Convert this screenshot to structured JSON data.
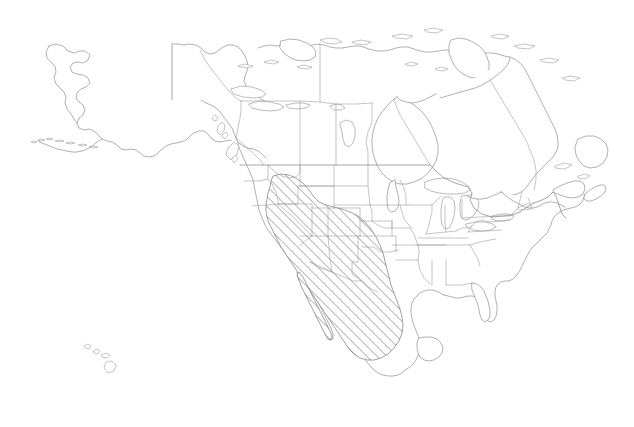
{
  "figure": {
    "kind": "range-map",
    "projection_note": "continental outline with first-level administrative subdivisions",
    "width_px": 634,
    "height_px": 427,
    "background_color": "#ffffff"
  },
  "styles": {
    "coastline_color": "#8c8f92",
    "subdivision_color": "#9a9da0",
    "national_border_color": "#85888b",
    "range_hatch_color": "#6b6e71",
    "range_fill_color": "#ffffff",
    "line_width_px": 0.7
  },
  "range": {
    "label": "shaded distribution area",
    "pattern": "diagonal-hatch",
    "hatch_angle_deg": 45,
    "hatch_spacing_px": 5,
    "hatch_stroke_width_px": 1.0,
    "coverage_note": "southwestern United States and northern Mexico including Baja California",
    "regions_covered": [
      "California",
      "Nevada",
      "Utah",
      "Arizona",
      "New Mexico",
      "southern Oregon",
      "southern Idaho",
      "western Colorado",
      "western Texas",
      "Baja California",
      "Sonora",
      "Chihuahua",
      "Coahuila",
      "Durango",
      "Zacatecas",
      "San Luis Potosi"
    ]
  },
  "landmasses": [
    {
      "name": "North American mainland",
      "type": "continent"
    },
    {
      "name": "Alaska",
      "type": "region"
    },
    {
      "name": "Aleutian Islands",
      "type": "island-chain"
    },
    {
      "name": "Canadian Arctic Archipelago",
      "type": "island-chain"
    },
    {
      "name": "Newfoundland",
      "type": "island"
    },
    {
      "name": "Nova Scotia",
      "type": "peninsula"
    },
    {
      "name": "Vancouver Island",
      "type": "island"
    },
    {
      "name": "Baja California Peninsula",
      "type": "peninsula"
    },
    {
      "name": "Yucatan Peninsula",
      "type": "peninsula"
    },
    {
      "name": "Florida Peninsula",
      "type": "peninsula"
    },
    {
      "name": "Hawaiian Islands",
      "type": "island-chain"
    }
  ],
  "water_features": [
    {
      "name": "Hudson Bay",
      "type": "bay"
    },
    {
      "name": "Gulf of Mexico",
      "type": "gulf"
    },
    {
      "name": "Great Lakes",
      "type": "lake-group"
    },
    {
      "name": "Lake Superior",
      "type": "lake"
    },
    {
      "name": "Lake Michigan",
      "type": "lake"
    },
    {
      "name": "Lake Huron",
      "type": "lake"
    },
    {
      "name": "Lake Erie",
      "type": "lake"
    },
    {
      "name": "Lake Ontario",
      "type": "lake"
    },
    {
      "name": "Great Slave Lake",
      "type": "lake"
    },
    {
      "name": "Great Bear Lake",
      "type": "lake"
    },
    {
      "name": "Lake Winnipeg",
      "type": "lake"
    },
    {
      "name": "Great Salt Lake",
      "type": "lake"
    },
    {
      "name": "Gulf of California",
      "type": "gulf"
    }
  ]
}
